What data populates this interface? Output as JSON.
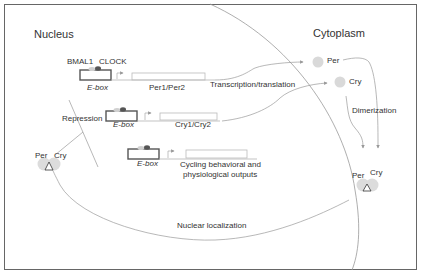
{
  "regions": {
    "nucleus": "Nucleus",
    "cytoplasm": "Cytoplasm"
  },
  "activators": {
    "bmal1": "BMAL1",
    "clock": "CLOCK"
  },
  "genes": [
    {
      "promoter": "E-box",
      "gene": "Per1/Per2"
    },
    {
      "promoter": "E-box",
      "gene": "Cry1/Cry2"
    },
    {
      "promoter": "E-box",
      "gene": "Cycling behavioral and physiological outputs"
    }
  ],
  "outputs": {
    "line1": "Cycling behavioral and",
    "line2": "physiological outputs"
  },
  "processes": {
    "transcription": "Transcription/translation",
    "dimerization": "Dimerization",
    "nuclear_localization": "Nuclear localization",
    "repression": "Repression"
  },
  "proteins": {
    "cyto_per": "Per",
    "cyto_cry": "Cry",
    "dimer_cyto_per": "Per",
    "dimer_cyto_cry": "Cry",
    "dimer_nuc_per": "Per",
    "dimer_nuc_cry": "Cry"
  },
  "colors": {
    "line": "#9a9a9a",
    "box_border": "#555555",
    "protein": "#d6d6d6",
    "dark_dot": "#555555"
  }
}
